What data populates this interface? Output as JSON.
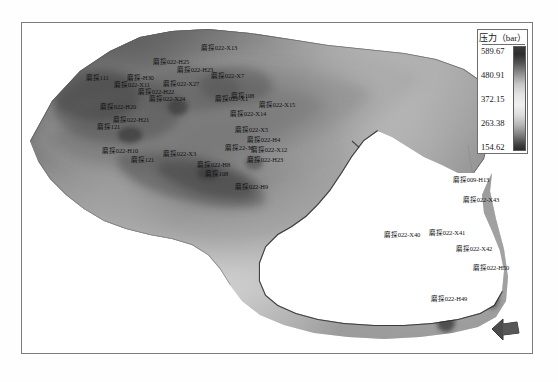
{
  "figure": {
    "kind": "grayscale-pressure-contour-map",
    "has_frame": true
  },
  "legend": {
    "title": "压力（bar）",
    "unit": "bar",
    "ticks": [
      "589.67",
      "480.91",
      "372.15",
      "263.38",
      "154.62"
    ],
    "max": 589.67,
    "min": 154.62,
    "ramp_dark_high": "#2d2d2d",
    "ramp_light_mid": "#efefef",
    "ramp_dark_low": "#2a2a2a",
    "border_color": "#6e6e6e"
  },
  "north_arrow": {
    "name": "north-arrow",
    "direction": "left",
    "color": "#4a4a4a"
  },
  "wells": [
    {
      "label": "磨探022-X13",
      "x": 200,
      "y": 44
    },
    {
      "label": "磨探022-H25",
      "x": 152,
      "y": 58
    },
    {
      "label": "磨探022-H23",
      "x": 176,
      "y": 66
    },
    {
      "label": "磨探022-X7",
      "x": 210,
      "y": 72
    },
    {
      "label": "磨探111",
      "x": 85,
      "y": 74
    },
    {
      "label": "磨探-H30",
      "x": 126,
      "y": 74
    },
    {
      "label": "磨探022-X11",
      "x": 113,
      "y": 81
    },
    {
      "label": "磨探022-X27",
      "x": 162,
      "y": 80
    },
    {
      "label": "磨探022-H22",
      "x": 137,
      "y": 88
    },
    {
      "label": "磨探022-X24",
      "x": 148,
      "y": 95
    },
    {
      "label": "磨探022-H20",
      "x": 99,
      "y": 103
    },
    {
      "label": "磨探022-X1",
      "x": 214,
      "y": 95
    },
    {
      "label": "磨探108",
      "x": 230,
      "y": 92
    },
    {
      "label": "磨探022-X15",
      "x": 258,
      "y": 101
    },
    {
      "label": "磨探022-X14",
      "x": 229,
      "y": 110
    },
    {
      "label": "磨探022-H21",
      "x": 112,
      "y": 116
    },
    {
      "label": "磨探121",
      "x": 96,
      "y": 123
    },
    {
      "label": "磨探022-X5",
      "x": 234,
      "y": 126
    },
    {
      "label": "磨探022-H4",
      "x": 246,
      "y": 136
    },
    {
      "label": "磨探22-36",
      "x": 224,
      "y": 144
    },
    {
      "label": "磨探022-H10",
      "x": 101,
      "y": 147
    },
    {
      "label": "磨探022-X3",
      "x": 162,
      "y": 150
    },
    {
      "label": "磨探022-X12",
      "x": 250,
      "y": 146
    },
    {
      "label": "磨探022-H23",
      "x": 246,
      "y": 156
    },
    {
      "label": "磨探121",
      "x": 130,
      "y": 156
    },
    {
      "label": "磨探022-H8",
      "x": 196,
      "y": 161
    },
    {
      "label": "磨探108",
      "x": 204,
      "y": 170
    },
    {
      "label": "磨探022-H9",
      "x": 234,
      "y": 183
    },
    {
      "label": "磨探009-H13",
      "x": 452,
      "y": 176
    },
    {
      "label": "磨探022-X43",
      "x": 462,
      "y": 196
    },
    {
      "label": "磨探022-X40",
      "x": 383,
      "y": 231
    },
    {
      "label": "磨探022-X41",
      "x": 428,
      "y": 229
    },
    {
      "label": "磨探022-X42",
      "x": 455,
      "y": 245
    },
    {
      "label": "磨探022-H50",
      "x": 472,
      "y": 264
    },
    {
      "label": "磨探022-H49",
      "x": 430,
      "y": 295
    }
  ]
}
